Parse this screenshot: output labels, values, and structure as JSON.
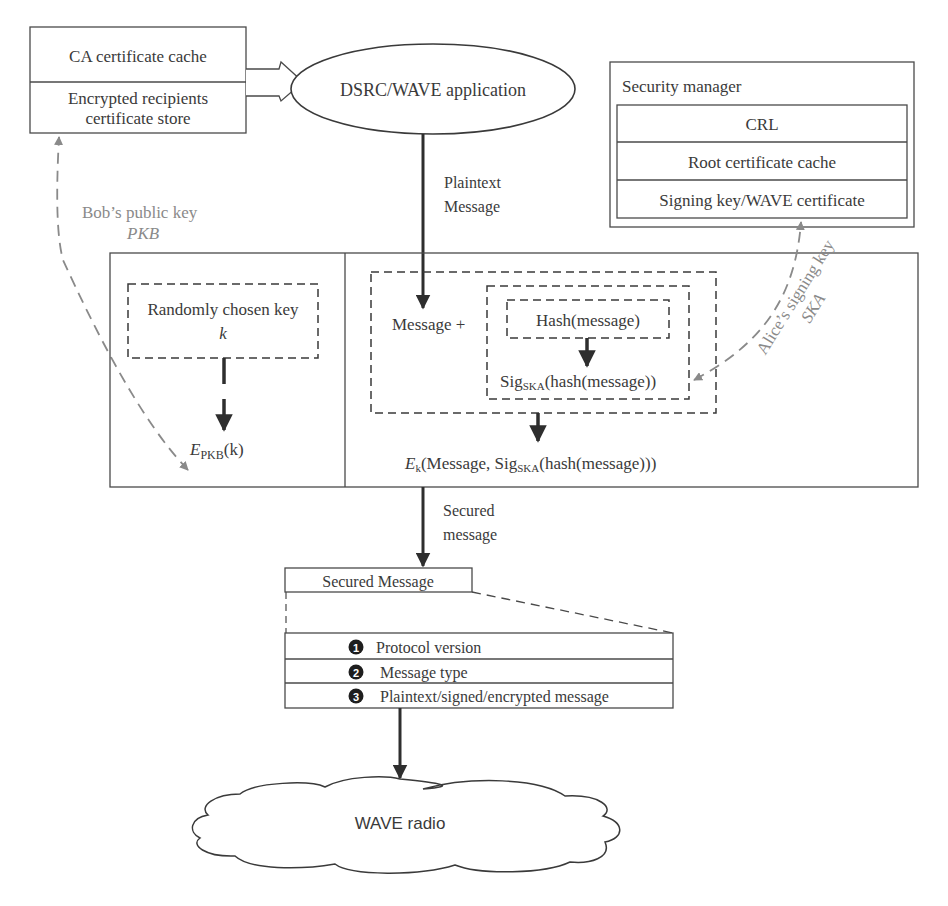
{
  "diagram": {
    "ca_store": {
      "rows": [
        "CA certificate cache",
        "Encrypted recipients",
        "certificate store"
      ]
    },
    "application": {
      "label": "DSRC/WAVE application"
    },
    "plaintext_label": [
      "Plaintext",
      "Message"
    ],
    "security_manager": {
      "title": "Security manager",
      "rows": [
        "CRL",
        "Root certificate cache",
        "Signing key/WAVE certificate"
      ]
    },
    "bob_key": {
      "label": "Bob’s public key",
      "symbol": "PKB"
    },
    "alice_key": {
      "label": "Alice’s signing key",
      "symbol": "SKA"
    },
    "encryption_panel": {
      "random_key_label": "Randomly chosen key",
      "random_key_symbol": "k",
      "encrypted_key": {
        "base": "E",
        "sub": "PKB",
        "arg": "(k)"
      }
    },
    "signing_panel": {
      "message_plus": "Message +",
      "hash_label": "Hash(message)",
      "sig": {
        "base": "Sig",
        "sub": "SKA",
        "rest": "(hash(message))"
      },
      "output": {
        "base": "E",
        "sub": "k",
        "rest1": "(Message, Sig",
        "sub2": "SKA",
        "rest2": "(hash(message)))"
      }
    },
    "secured_label": [
      "Secured",
      "message"
    ],
    "secured_message": {
      "title": "Secured Message",
      "fields": [
        {
          "num": "1",
          "label": "Protocol version"
        },
        {
          "num": "2",
          "label": "Message type"
        },
        {
          "num": "3",
          "label": "Plaintext/signed/encrypted message"
        }
      ]
    },
    "radio": {
      "label": "WAVE radio"
    },
    "colors": {
      "line": "#3a3a3a",
      "key_arrow": "#8a8a8a",
      "background": "#ffffff"
    }
  }
}
